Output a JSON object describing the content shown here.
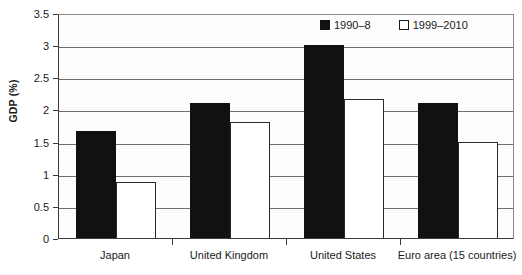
{
  "chart_data": {
    "type": "bar",
    "title": "",
    "xlabel": "",
    "ylabel": "GDP (%)",
    "categories": [
      "Japan",
      "United Kingdom",
      "United States",
      "Euro area (15 countries)"
    ],
    "series": [
      {
        "name": "1990–8",
        "color": "#111111",
        "values": [
          1.67,
          2.1,
          3.0,
          2.1
        ]
      },
      {
        "name": "1999–2010",
        "color": "#ffffff",
        "values": [
          0.87,
          1.8,
          2.17,
          1.5
        ]
      }
    ],
    "ylim": [
      0,
      3.5
    ],
    "ytick_labels": [
      "0",
      "0.5",
      "1",
      "1.5",
      "2",
      "2.5",
      "3",
      "3.5"
    ],
    "ytick_values": [
      0,
      0.5,
      1,
      1.5,
      2,
      2.5,
      3,
      3.5
    ],
    "grid": true,
    "legend_position": "top-right"
  },
  "legend": {
    "items": [
      {
        "label": "1990–8",
        "style": "dark"
      },
      {
        "label": "1999–2010",
        "style": "light"
      }
    ]
  }
}
